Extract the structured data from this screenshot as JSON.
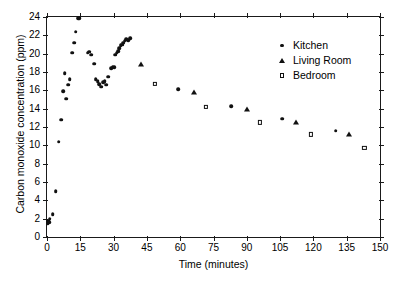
{
  "chart_data": {
    "type": "scatter",
    "title": "",
    "xlabel": "Time (minutes)",
    "ylabel": "Carbon monoxide concentration (ppm)",
    "xlim": [
      0,
      150
    ],
    "ylim": [
      0,
      24
    ],
    "xticks": [
      0,
      15,
      30,
      45,
      60,
      75,
      90,
      105,
      120,
      135,
      150
    ],
    "yticks": [
      0,
      2,
      4,
      6,
      8,
      10,
      12,
      14,
      16,
      18,
      20,
      22,
      24
    ],
    "grid": false,
    "legend_position": "upper right",
    "marker_color": "#111111",
    "series": [
      {
        "name": "Kitchen",
        "marker": "filled-circle",
        "points": [
          [
            0.3,
            1.5
          ],
          [
            0.6,
            1.8
          ],
          [
            0.9,
            1.6
          ],
          [
            1.2,
            2.0
          ],
          [
            2.6,
            2.5
          ],
          [
            4.0,
            5.0
          ],
          [
            5.2,
            10.4
          ],
          [
            6.4,
            12.8
          ],
          [
            7.4,
            15.9
          ],
          [
            7.9,
            17.9
          ],
          [
            8.6,
            15.1
          ],
          [
            9.6,
            16.6
          ],
          [
            10.3,
            17.2
          ],
          [
            11.4,
            20.1
          ],
          [
            12.2,
            21.2
          ],
          [
            13.0,
            22.4
          ],
          [
            14.0,
            23.9
          ],
          [
            14.6,
            23.9
          ],
          [
            18.4,
            20.1
          ],
          [
            19.0,
            20.2
          ],
          [
            19.8,
            19.9
          ],
          [
            21.2,
            18.9
          ],
          [
            22.0,
            17.2
          ],
          [
            22.8,
            17.0
          ],
          [
            23.6,
            16.7
          ],
          [
            24.4,
            16.4
          ],
          [
            25.2,
            16.9
          ],
          [
            26.0,
            17.0
          ],
          [
            26.8,
            16.6
          ],
          [
            27.6,
            17.5
          ],
          [
            28.8,
            18.4
          ],
          [
            29.6,
            18.6
          ],
          [
            30.2,
            18.5
          ],
          [
            30.8,
            19.9
          ],
          [
            31.4,
            20.1
          ],
          [
            32.0,
            20.3
          ],
          [
            32.6,
            20.6
          ],
          [
            33.2,
            20.9
          ],
          [
            33.8,
            21.0
          ],
          [
            34.4,
            21.2
          ],
          [
            35.0,
            21.4
          ],
          [
            35.8,
            21.6
          ],
          [
            36.6,
            21.5
          ],
          [
            37.4,
            21.7
          ],
          [
            59.0,
            16.1
          ],
          [
            83.0,
            14.3
          ],
          [
            106.0,
            12.9
          ],
          [
            130.0,
            11.6
          ]
        ]
      },
      {
        "name": "Living Room",
        "marker": "filled-triangle",
        "points": [
          [
            42.5,
            18.9
          ],
          [
            66.0,
            15.8
          ],
          [
            90.0,
            14.0
          ],
          [
            112.0,
            12.5
          ],
          [
            136.0,
            11.2
          ]
        ]
      },
      {
        "name": "Bedroom",
        "marker": "open-square",
        "points": [
          [
            48.5,
            16.7
          ],
          [
            71.5,
            14.2
          ],
          [
            96.0,
            12.5
          ],
          [
            119.0,
            11.2
          ],
          [
            143.0,
            9.7
          ]
        ]
      }
    ]
  }
}
